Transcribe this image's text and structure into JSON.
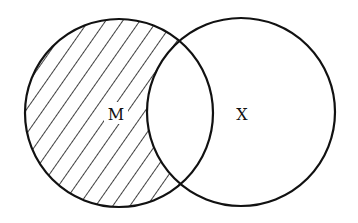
{
  "diagram": {
    "type": "venn",
    "sets": [
      {
        "id": "M",
        "label": "M",
        "cx": 119,
        "cy": 113,
        "r": 94,
        "shaded": "only-M"
      },
      {
        "id": "X",
        "label": "X",
        "cx": 241,
        "cy": 112,
        "r": 94,
        "shaded": "none"
      }
    ],
    "shaded_region": "M minus X (hatched)",
    "colors": {
      "stroke": "#111111",
      "background": "#ffffff"
    }
  }
}
